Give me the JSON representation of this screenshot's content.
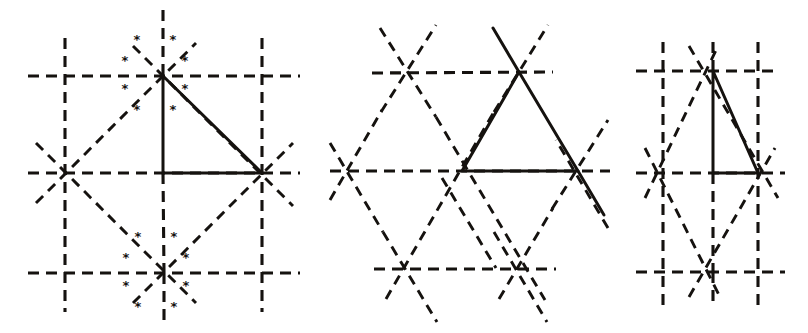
{
  "figure": {
    "background_color": "#ffffff",
    "line_color": "#15120f",
    "width": 808,
    "height": 333,
    "star_glyph": "*",
    "panel_count": 3
  },
  "panels": [
    {
      "id": "panel-left",
      "name": "square-lattice-with-stars",
      "lattice_type": "square",
      "nodes_x": [
        65,
        163,
        262
      ],
      "nodes_y": [
        76,
        173,
        273
      ],
      "marked_vertices": [
        {
          "name": "top-center-vertex",
          "x": 163,
          "y": 76,
          "star_count": 8
        },
        {
          "name": "bottom-center-vertex",
          "x": 164,
          "y": 273,
          "star_count": 8
        }
      ],
      "solid_triangle": {
        "name": "right-triangle",
        "points": "163,76 262,173 163,173",
        "vertices": [
          {
            "x": 163,
            "y": 76
          },
          {
            "x": 262,
            "y": 173
          },
          {
            "x": 163,
            "y": 173
          }
        ]
      },
      "star_offsets": [
        {
          "dx": -26,
          "dy": -36
        },
        {
          "dx": 10,
          "dy": -36
        },
        {
          "dx": -38,
          "dy": -15
        },
        {
          "dx": 22,
          "dy": -15
        },
        {
          "dx": -38,
          "dy": 13
        },
        {
          "dx": 22,
          "dy": 13
        },
        {
          "dx": -26,
          "dy": 34
        },
        {
          "dx": 10,
          "dy": 34
        }
      ]
    },
    {
      "id": "panel-middle",
      "name": "triangular-lattice",
      "lattice_type": "triangular",
      "nodes": [
        {
          "x": 406,
          "y": 73
        },
        {
          "x": 519,
          "y": 72
        },
        {
          "x": 350,
          "y": 171
        },
        {
          "x": 462,
          "y": 171
        },
        {
          "x": 578,
          "y": 171
        },
        {
          "x": 408,
          "y": 269
        },
        {
          "x": 520,
          "y": 269
        }
      ],
      "solid_triangle": {
        "name": "equilateral-triangle",
        "points": "519,72 578,171 462,171",
        "vertices": [
          {
            "x": 519,
            "y": 72
          },
          {
            "x": 578,
            "y": 171
          },
          {
            "x": 462,
            "y": 171
          }
        ]
      }
    },
    {
      "id": "panel-right",
      "name": "rectangular-lattice",
      "lattice_type": "rectangular",
      "nodes_x": [
        663,
        713,
        758
      ],
      "nodes_y": [
        71,
        173,
        272
      ],
      "solid_triangle": {
        "name": "tall-triangle",
        "points": "713,71 758,173 713,173",
        "vertices": [
          {
            "x": 713,
            "y": 71
          },
          {
            "x": 758,
            "y": 173
          },
          {
            "x": 713,
            "y": 173
          }
        ]
      }
    }
  ]
}
